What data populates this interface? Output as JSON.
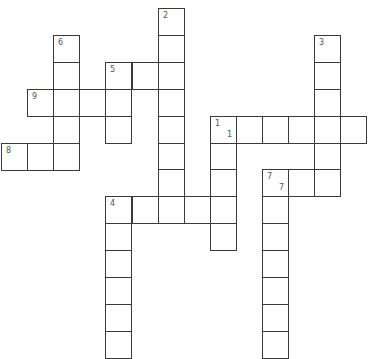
{
  "puzzle": {
    "grid": {
      "origin_x": 1,
      "origin_y": 8,
      "cell_w": 26.1,
      "cell_h": 26.9
    },
    "colors": {
      "line": "#3a3a3a",
      "number": "#555555",
      "background": "#ffffff"
    },
    "clues": [
      {
        "number": "1",
        "direction": "across",
        "col": 8,
        "row": 4,
        "length": 6
      },
      {
        "number": "1",
        "direction": "down",
        "col": 8,
        "row": 4,
        "length": 5
      },
      {
        "number": "2",
        "direction": "down",
        "col": 6,
        "row": 0,
        "length": 8
      },
      {
        "number": "3",
        "direction": "down",
        "col": 12,
        "row": 1,
        "length": 6
      },
      {
        "number": "4",
        "direction": "across",
        "col": 4,
        "row": 7,
        "length": 5
      },
      {
        "number": "4",
        "direction": "down",
        "col": 4,
        "row": 7,
        "length": 6
      },
      {
        "number": "5",
        "direction": "across",
        "col": 4,
        "row": 2,
        "length": 3
      },
      {
        "number": "5",
        "direction": "down",
        "col": 4,
        "row": 2,
        "length": 3
      },
      {
        "number": "6",
        "direction": "down",
        "col": 2,
        "row": 1,
        "length": 5
      },
      {
        "number": "7",
        "direction": "across",
        "col": 10,
        "row": 6,
        "length": 3
      },
      {
        "number": "7",
        "direction": "down",
        "col": 10,
        "row": 6,
        "length": 7
      },
      {
        "number": "8",
        "direction": "across",
        "col": 0,
        "row": 5,
        "length": 3
      },
      {
        "number": "9",
        "direction": "across",
        "col": 1,
        "row": 3,
        "length": 4
      }
    ],
    "labels": [
      {
        "col": 6,
        "row": 0,
        "text": "2"
      },
      {
        "col": 2,
        "row": 1,
        "text": "6"
      },
      {
        "col": 12,
        "row": 1,
        "text": "3"
      },
      {
        "col": 4,
        "row": 2,
        "text": "5"
      },
      {
        "col": 1,
        "row": 3,
        "text": "9"
      },
      {
        "col": 8,
        "row": 4,
        "text": "1",
        "secondary": "1"
      },
      {
        "col": 0,
        "row": 5,
        "text": "8"
      },
      {
        "col": 10,
        "row": 6,
        "text": "7",
        "secondary": "7"
      },
      {
        "col": 4,
        "row": 7,
        "text": "4"
      }
    ]
  }
}
